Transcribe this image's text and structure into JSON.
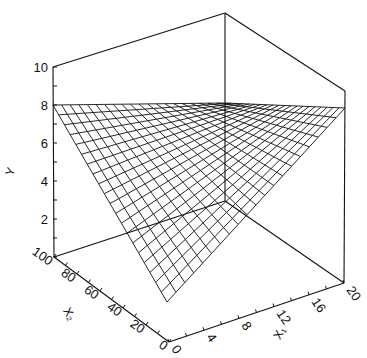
{
  "chart_data": {
    "type": "surface3d",
    "title": "",
    "zlabel": "Y",
    "xlabel": "X1",
    "ylabel": "X2",
    "x1_axis": {
      "label": "X₁",
      "range": [
        0,
        20
      ],
      "ticks": [
        "0",
        "4",
        "8",
        "12",
        "16",
        "20"
      ]
    },
    "x2_axis": {
      "label": "X₂",
      "range": [
        0,
        100
      ],
      "ticks": [
        "0",
        "20",
        "40",
        "60",
        "80",
        "100"
      ]
    },
    "y_axis": {
      "label": "Y",
      "range": [
        0,
        10
      ],
      "ticks": [
        "2",
        "4",
        "6",
        "8",
        "10"
      ]
    },
    "grid_divisions": 20,
    "surface": {
      "description": "planar mesh surface",
      "corners": [
        {
          "x1": 0,
          "x2": 100,
          "y": 8
        },
        {
          "x1": 20,
          "x2": 100,
          "y": 8
        },
        {
          "x1": 20,
          "x2": 0,
          "y": 8
        },
        {
          "x1": 0,
          "x2": 0,
          "y": 2
        }
      ]
    }
  },
  "labels": {
    "y_axis_label": "Y",
    "x1_axis_label": "X₁",
    "x2_axis_label": "X₂"
  }
}
